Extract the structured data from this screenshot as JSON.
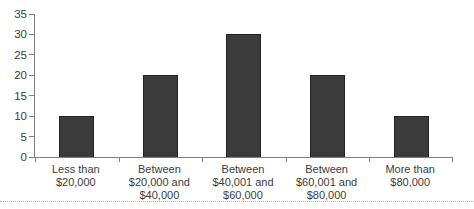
{
  "chart_data": {
    "type": "bar",
    "title": "",
    "xlabel": "",
    "ylabel": "",
    "categories": [
      "Less than\n$20,000",
      "Between\n$20,000 and\n$40,000",
      "Between\n$40,001 and\n$60,000",
      "Between\n$60,001 and\n$80,000",
      "More than\n$80,000"
    ],
    "values": [
      10,
      20,
      30,
      20,
      10
    ],
    "ylim": [
      0,
      35
    ],
    "yticks": [
      0,
      5,
      10,
      15,
      20,
      25,
      30,
      35
    ],
    "grid": false,
    "legend": "none",
    "bar_color": "#3b3b3b",
    "bar_border_color": "#232323",
    "axis_color": "#7f7f7f",
    "text_color": "#3b3b3b",
    "divider_color": "#b5b5b5"
  }
}
